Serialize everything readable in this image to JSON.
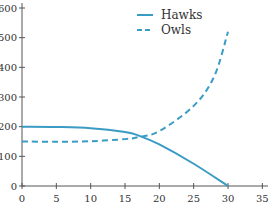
{
  "chart_data": {
    "type": "line",
    "title": "",
    "xlabel": "",
    "ylabel": "",
    "xlim": [
      0,
      35
    ],
    "ylim": [
      0,
      600
    ],
    "x_ticks": [
      0,
      5,
      10,
      15,
      20,
      25,
      30,
      35
    ],
    "y_ticks": [
      0,
      100,
      200,
      300,
      400,
      500,
      600
    ],
    "grid": false,
    "legend_position": "top-center-right",
    "series": [
      {
        "name": "Hawks",
        "style": "solid",
        "color": "#3a9cc4",
        "x": [
          0,
          5,
          10,
          15,
          17,
          20,
          25,
          30
        ],
        "y": [
          200,
          199,
          195,
          182,
          170,
          140,
          75,
          0
        ]
      },
      {
        "name": "Owls",
        "style": "dashed",
        "color": "#3a9cc4",
        "x": [
          0,
          5,
          10,
          15,
          17,
          20,
          25,
          28,
          30
        ],
        "y": [
          150,
          149,
          151,
          158,
          165,
          185,
          270,
          370,
          520
        ]
      }
    ]
  },
  "legend": {
    "items": [
      {
        "label": "Hawks",
        "style": "solid"
      },
      {
        "label": "Owls",
        "style": "dashed"
      }
    ]
  }
}
